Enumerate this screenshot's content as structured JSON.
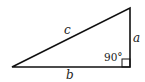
{
  "diagram": {
    "type": "right-triangle",
    "colors": {
      "stroke": "#111111",
      "text": "#222222",
      "background": "#ffffff"
    },
    "vertices": {
      "bottom_left": [
        12,
        67
      ],
      "bottom_right": [
        130,
        67
      ],
      "top_right": [
        130,
        8
      ]
    },
    "sides": {
      "hypotenuse": "c",
      "vertical_leg": "a",
      "horizontal_leg": "b"
    },
    "angle": {
      "label": "90°",
      "marker": "right-angle-square"
    }
  }
}
